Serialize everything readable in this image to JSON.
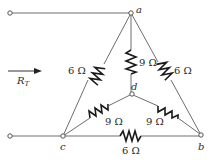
{
  "diagram": {
    "type": "circuit",
    "input_label": "R",
    "input_label_sub": "T",
    "nodes": {
      "a": {
        "label": "a"
      },
      "b": {
        "label": "b"
      },
      "c": {
        "label": "c"
      },
      "d": {
        "label": "d"
      }
    },
    "resistors": {
      "ca": {
        "label": "6 Ω",
        "from": "c",
        "to": "a",
        "value": 6
      },
      "ab": {
        "label": "6 Ω",
        "from": "a",
        "to": "b",
        "value": 6
      },
      "cb": {
        "label": "6 Ω",
        "from": "c",
        "to": "b",
        "value": 6
      },
      "ad": {
        "label": "9 Ω",
        "from": "a",
        "to": "d",
        "value": 9
      },
      "cd": {
        "label": "9 Ω",
        "from": "c",
        "to": "d",
        "value": 9
      },
      "db": {
        "label": "9 Ω",
        "from": "d",
        "to": "b",
        "value": 9
      }
    },
    "colors": {
      "wire": "#6e6e6e",
      "resistor": "#1a1a1a",
      "text": "#2a2a2a",
      "background": "#ffffff"
    }
  }
}
